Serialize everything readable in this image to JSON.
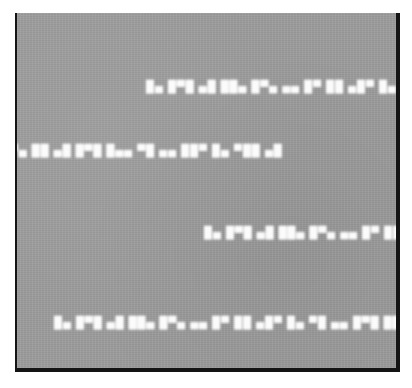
{
  "window": {
    "title": "Degraded text capture",
    "background_color": "#ffffff"
  },
  "panel": {
    "name": "grey-text-panel",
    "surface_color": "#9d9d9d",
    "border_color": "#141414",
    "border_width_px": 2,
    "x": 15,
    "y": 13,
    "width": 385,
    "height": 359,
    "texture": "fine horizontal scan noise / film grain"
  },
  "content": {
    "legibility": "illegible",
    "note": "Four horizontal rows of heavily blurred light-on-grey text. Individual glyphs are smeared into rectangular blobs and cannot be resolved.",
    "text_color": "#f4f4f4",
    "rows": [
      {
        "id": "text-row-1",
        "index": 1,
        "text": "█▄ █▀█ ▄█ ██▄ █▀▄ ▄▄ █▀ ██ ▄█▀ █▄ ▀█ ▄▄ █▀█ ██▄ ▄",
        "x": 146,
        "y": 80,
        "width": 249,
        "height": 13,
        "clipped_right": true
      },
      {
        "id": "text-row-2",
        "index": 2,
        "text": "█▀▄ ██ ▄█ █▀█ █▄▄ ▀█ ▄▄ ██▀ █▄ ▀██ ▄█",
        "x": 1,
        "y": 144,
        "width": 248,
        "height": 13,
        "clipped_right": false
      },
      {
        "id": "text-row-3",
        "index": 3,
        "text": "█▄ █▀█ ▄█ ██▄ █▀▄ ▄▄ █▀ ██ ▄█▀ █▄ ▀█",
        "x": 204,
        "y": 226,
        "width": 191,
        "height": 13,
        "clipped_right": true
      },
      {
        "id": "text-row-4",
        "index": 4,
        "text": "█▄ █▀█ ▄█ ██▄ █▀▄ ▄▄ █▀ ██ ▄█▀ █▄ ▀█ ▄▄ █▀█ ██▄",
        "x": 54,
        "y": 316,
        "width": 291,
        "height": 13,
        "clipped_right": false
      }
    ]
  }
}
